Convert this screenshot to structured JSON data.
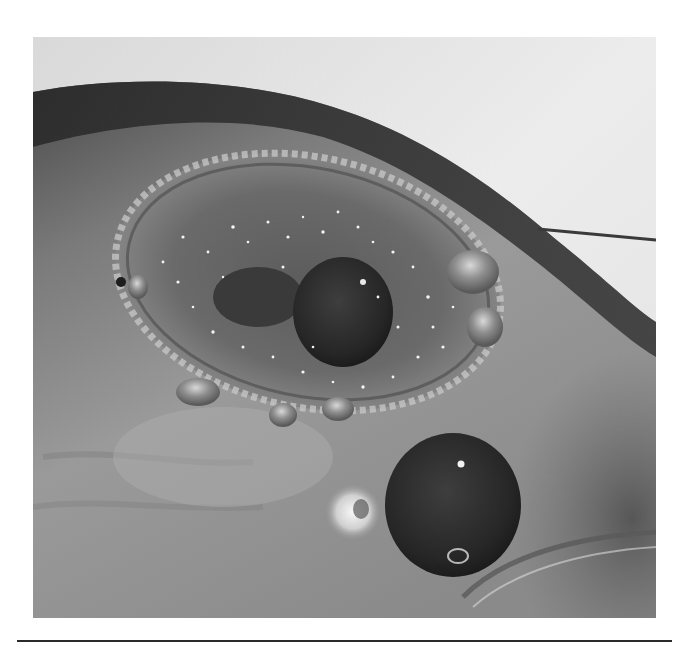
{
  "figure": {
    "type": "clinical-photograph",
    "color_mode": "grayscale",
    "caption": "",
    "colors": {
      "page_background": "#ffffff",
      "rule": "#2a2a2a",
      "background_sheet": "#e6e6e6",
      "skin_mid": "#8c8c8c",
      "skin_dark": "#3a3a3a",
      "lesion_core": "#2e2e2e",
      "highlight": "#f4f4f4"
    }
  }
}
